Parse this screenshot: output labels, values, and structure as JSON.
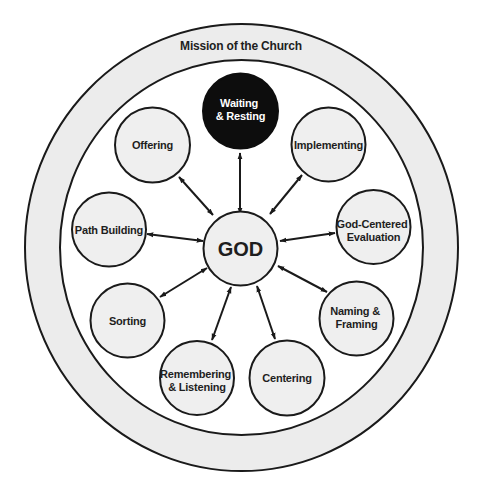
{
  "ring": {
    "label": "Mission of the Church"
  },
  "center": {
    "label": "GOD"
  },
  "nodes": [
    {
      "id": "waiting-resting",
      "lines": [
        "Waiting",
        "& Resting"
      ],
      "highlighted": true
    },
    {
      "id": "implementing",
      "lines": [
        "Implementing"
      ]
    },
    {
      "id": "god-centered-evaluation",
      "lines": [
        "God-Centered",
        "Evaluation"
      ]
    },
    {
      "id": "naming-framing",
      "lines": [
        "Naming &",
        "Framing"
      ]
    },
    {
      "id": "centering",
      "lines": [
        "Centering"
      ]
    },
    {
      "id": "remembering-listening",
      "lines": [
        "Remembering",
        "& Listening"
      ]
    },
    {
      "id": "sorting",
      "lines": [
        "Sorting"
      ]
    },
    {
      "id": "path-building",
      "lines": [
        "Path Building"
      ]
    },
    {
      "id": "offering",
      "lines": [
        "Offering"
      ]
    }
  ],
  "connections": "Each outer node is connected to GOD by a double-headed arrow",
  "colors": {
    "node_fill": "#efefef",
    "ring_fill": "#ececec",
    "highlight_fill": "#0d0d0d",
    "stroke": "#1a1a1a"
  }
}
